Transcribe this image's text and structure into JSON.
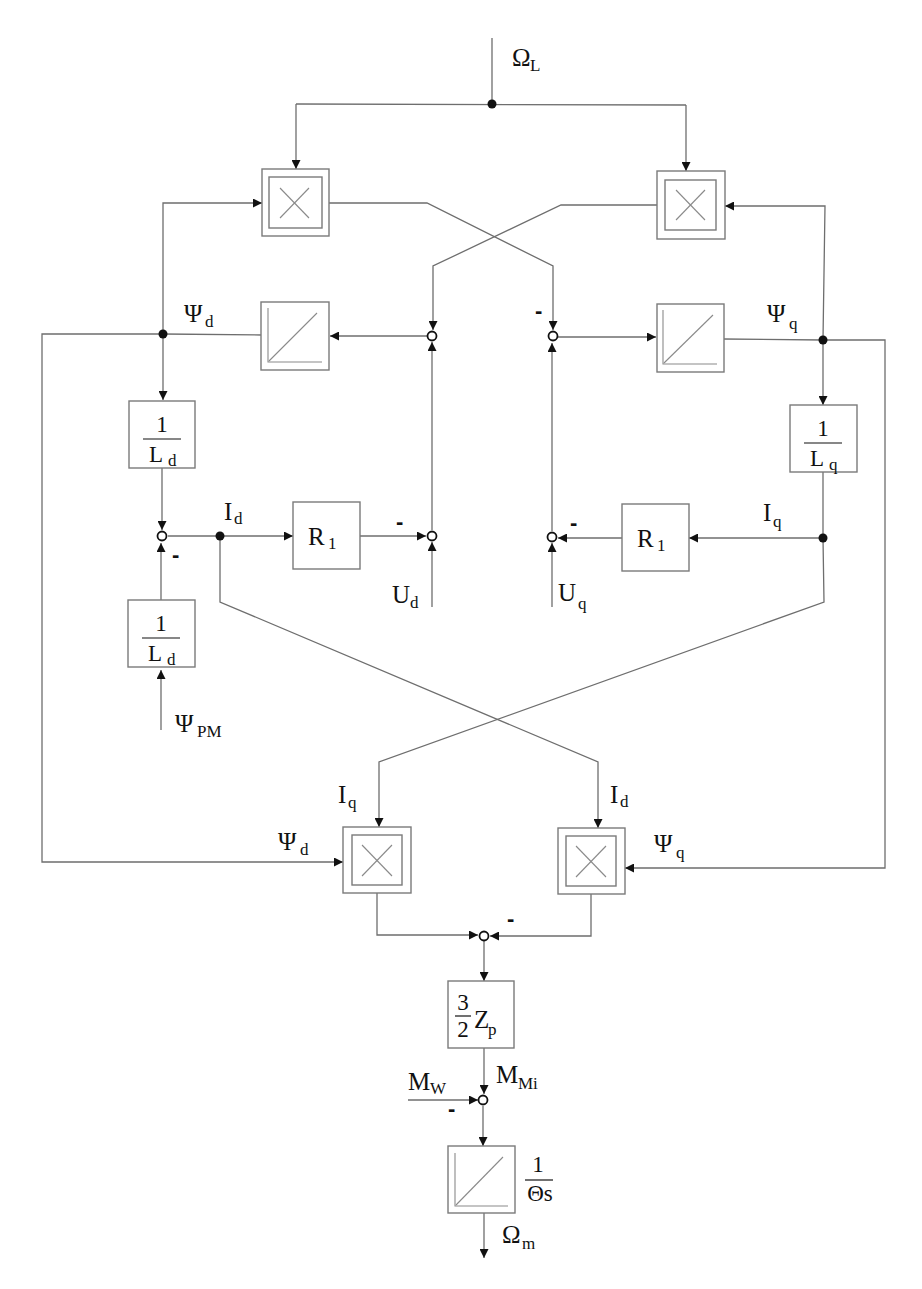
{
  "diagram": {
    "type": "block-diagram",
    "inputs": {
      "omega_L": {
        "sym": "Ω",
        "sub": "L"
      },
      "u_d": {
        "sym": "U",
        "sub": "d"
      },
      "u_q": {
        "sym": "U",
        "sub": "q"
      },
      "psi_pm": {
        "sym": "Ψ",
        "sub": "PM"
      },
      "m_w": {
        "sym": "M",
        "sub": "W"
      }
    },
    "signals": {
      "psi_d": {
        "sym": "Ψ",
        "sub": "d"
      },
      "psi_q": {
        "sym": "Ψ",
        "sub": "q"
      },
      "i_d": {
        "sym": "I",
        "sub": "d"
      },
      "i_q": {
        "sym": "I",
        "sub": "q"
      },
      "m_mi": {
        "sym": "M",
        "sub": "Mi"
      },
      "psi_d_lower": {
        "sym": "Ψ",
        "sub": "d"
      },
      "psi_q_lower": {
        "sym": "Ψ",
        "sub": "q"
      },
      "i_q_lower": {
        "sym": "I",
        "sub": "q"
      },
      "i_d_lower": {
        "sym": "I",
        "sub": "d"
      }
    },
    "outputs": {
      "omega_m": {
        "sym": "Ω",
        "sub": "m"
      }
    },
    "blocks": {
      "gain_ld": {
        "num": "1",
        "den": "L",
        "den_sub": "d"
      },
      "gain_lq": {
        "num": "1",
        "den": "L",
        "den_sub": "q"
      },
      "gain_ld_pm": {
        "num": "1",
        "den": "L",
        "den_sub": "d"
      },
      "r1_d": {
        "sym": "R",
        "sub": "1"
      },
      "r1_q": {
        "sym": "R",
        "sub": "1"
      },
      "torque_gain": {
        "num": "3",
        "den": "2",
        "sym": "Z",
        "sub": "p"
      },
      "mech_integrator": {
        "num": "1",
        "den": "Θs"
      },
      "multipliers": [
        "mult-top-left",
        "mult-top-right",
        "mult-bottom-left",
        "mult-bottom-right"
      ],
      "integrators": [
        "int-psi-d",
        "int-psi-q",
        "int-omega"
      ]
    },
    "sign_marks": {
      "minus": "-"
    }
  }
}
